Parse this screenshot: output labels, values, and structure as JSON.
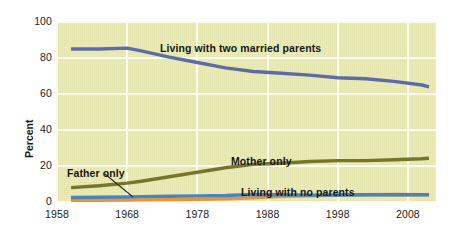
{
  "chart_data": {
    "type": "line",
    "title": "",
    "xlabel": "",
    "ylabel": "Percent",
    "xlim": [
      1958,
      2012
    ],
    "ylim": [
      0,
      100
    ],
    "grid": true,
    "legend_position": "inline-annotations",
    "x_ticks": [
      "1958",
      "1968",
      "1978",
      "1988",
      "1998",
      "2008"
    ],
    "y_ticks": [
      "0",
      "20",
      "40",
      "60",
      "80",
      "100"
    ],
    "background_color": "#eaeab2",
    "gridline_color": "#fbfbf0",
    "series": [
      {
        "name": "Living with two married parents",
        "color": "#5e6ca6",
        "label_x": 160,
        "label_y": 42,
        "x": [
          1960,
          1964,
          1968,
          1970,
          1974,
          1978,
          1982,
          1986,
          1990,
          1994,
          1998,
          2002,
          2006,
          2010,
          2011
        ],
        "values": [
          85,
          85,
          85.5,
          84,
          80.5,
          77.5,
          74.5,
          72.5,
          71.5,
          70.5,
          69,
          68.5,
          67,
          65,
          64
        ]
      },
      {
        "name": "Mother only",
        "color": "#76762a",
        "label_x": 231,
        "label_y": 155,
        "x": [
          1960,
          1964,
          1968,
          1970,
          1974,
          1978,
          1982,
          1986,
          1990,
          1994,
          1998,
          2002,
          2006,
          2010,
          2011
        ],
        "values": [
          8,
          9,
          10.5,
          11.5,
          14,
          16.5,
          19,
          21,
          21.5,
          22.5,
          23,
          23,
          23.5,
          24,
          24.3
        ]
      },
      {
        "name": "Living with no parents",
        "color": "#4a84bd",
        "label_x": 241,
        "label_y": 186,
        "x": [
          1960,
          1964,
          1968,
          1970,
          1974,
          1978,
          1982,
          1986,
          1990,
          1994,
          1998,
          2002,
          2006,
          2010,
          2011
        ],
        "values": [
          2.5,
          2.6,
          2.8,
          3,
          3.2,
          3.4,
          3.6,
          4.2,
          4,
          3.8,
          3.9,
          4,
          4,
          4,
          4
        ]
      },
      {
        "name": "Father only",
        "color": "#e8943a",
        "label_x": 67,
        "label_y": 167,
        "x": [
          1960,
          1964,
          1968,
          1970,
          1974,
          1978,
          1982,
          1986,
          1990,
          1994,
          1998,
          2002,
          2006,
          2010,
          2011
        ],
        "values": [
          1,
          1,
          1.1,
          1.2,
          1.3,
          1.5,
          1.8,
          2.3,
          3.1,
          3.4,
          3.8,
          4,
          4.2,
          4,
          4
        ]
      }
    ],
    "annotations": [
      {
        "text": "Living with two married parents",
        "series": "Living with two married parents"
      },
      {
        "text": "Mother only",
        "series": "Mother only"
      },
      {
        "text": "Living with no parents",
        "series": "Living with no parents"
      },
      {
        "text": "Father only",
        "series": "Father only"
      }
    ]
  }
}
